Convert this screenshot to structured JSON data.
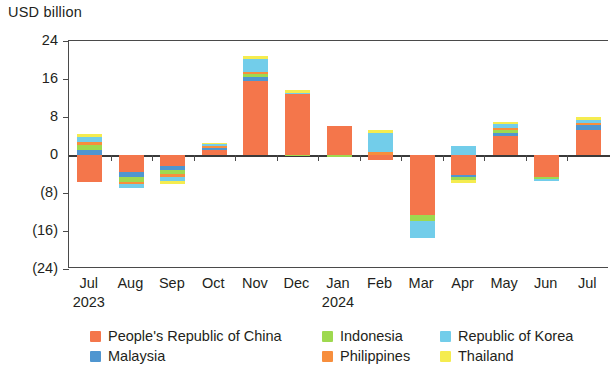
{
  "chart_data": {
    "type": "bar",
    "title": "",
    "subtitle": "",
    "ylabel": "USD billion",
    "xlabel": "",
    "stacked": true,
    "grid": false,
    "legend_position": "bottom",
    "ylim": [
      -24,
      24
    ],
    "yticks": [
      24,
      16,
      8,
      0,
      -8,
      -16,
      -24
    ],
    "ytick_labels": [
      "24",
      "16",
      "8",
      "0",
      "(8)",
      "(16)",
      "(24)"
    ],
    "categories": [
      "Jul",
      "Aug",
      "Sep",
      "Oct",
      "Nov",
      "Dec",
      "Jan",
      "Feb",
      "Mar",
      "Apr",
      "May",
      "Jun",
      "Jul"
    ],
    "year_markers": [
      {
        "label": "2023",
        "category_index": 0
      },
      {
        "label": "2024",
        "category_index": 6
      }
    ],
    "series": [
      {
        "name": "People's Republic of China",
        "color": "#f4764b",
        "values": [
          -5.6,
          -3.6,
          -2.3,
          1.1,
          15.6,
          12.8,
          6.1,
          -1.0,
          -12.6,
          -4.2,
          3.9,
          -4.6,
          5.3
        ]
      },
      {
        "name": "Malaysia",
        "color": "#4f96d0",
        "values": [
          1.1,
          -1.0,
          -0.9,
          0.3,
          0.9,
          0.0,
          0.0,
          0.0,
          0.0,
          -0.4,
          0.7,
          0.0,
          1.1
        ]
      },
      {
        "name": "Indonesia",
        "color": "#9ed94f",
        "values": [
          1.1,
          -1.1,
          -0.9,
          0.0,
          0.5,
          -0.3,
          -0.4,
          0.0,
          -1.3,
          -0.7,
          0.6,
          -0.4,
          0.0
        ]
      },
      {
        "name": "Philippines",
        "color": "#f78e3d",
        "values": [
          0.5,
          -0.5,
          -0.5,
          0.5,
          0.4,
          0.0,
          0.0,
          0.6,
          0.0,
          0.0,
          0.5,
          0.0,
          0.4
        ]
      },
      {
        "name": "Republic of Korea",
        "color": "#72cdea",
        "values": [
          1.1,
          -0.8,
          -0.9,
          0.4,
          2.9,
          0.3,
          0.0,
          4.0,
          -3.6,
          1.9,
          0.8,
          -0.4,
          0.6
        ]
      },
      {
        "name": "Thailand",
        "color": "#f5ec4f",
        "values": [
          0.7,
          0.0,
          -0.7,
          0.2,
          0.6,
          0.6,
          0.0,
          0.6,
          0.0,
          -0.5,
          0.5,
          0.0,
          0.7
        ]
      }
    ]
  },
  "legend": {
    "items": [
      {
        "label": "People's Republic of China",
        "color": "#f4764b",
        "col": 1,
        "row": 1
      },
      {
        "label": "Indonesia",
        "color": "#9ed94f",
        "col": 2,
        "row": 1
      },
      {
        "label": "Republic of Korea",
        "color": "#72cdea",
        "col": 3,
        "row": 1
      },
      {
        "label": "Malaysia",
        "color": "#4f96d0",
        "col": 1,
        "row": 2
      },
      {
        "label": "Philippines",
        "color": "#f78e3d",
        "col": 2,
        "row": 2
      },
      {
        "label": "Thailand",
        "color": "#f5ec4f",
        "col": 3,
        "row": 2
      }
    ]
  }
}
